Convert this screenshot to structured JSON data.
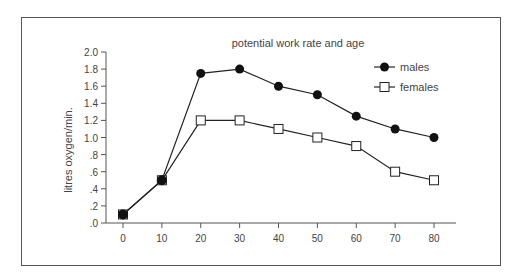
{
  "chart_data": {
    "type": "line",
    "title": "potential work rate and age",
    "xlabel": "",
    "ylabel": "litres oxygen/min.",
    "x": [
      0,
      10,
      20,
      30,
      40,
      50,
      60,
      70,
      80
    ],
    "x_tick_labels": [
      "0",
      "10",
      "20",
      "30",
      "40",
      "50",
      "60",
      "70",
      "80"
    ],
    "y_tick_values": [
      0,
      0.2,
      0.4,
      0.6,
      0.8,
      1.0,
      1.2,
      1.4,
      1.6,
      1.8,
      2.0
    ],
    "y_tick_labels": [
      ".0",
      ".2",
      ".4",
      ".6",
      ".8",
      "1.0",
      "1.2",
      "1.4",
      "1.6",
      "1.8",
      "2.0"
    ],
    "xlim": [
      0,
      80
    ],
    "ylim": [
      0,
      2.0
    ],
    "grid": false,
    "legend_position": "upper right",
    "series": [
      {
        "name": "males",
        "marker": "filled-circle",
        "values": [
          0.1,
          0.5,
          1.75,
          1.8,
          1.6,
          1.5,
          1.25,
          1.1,
          1.0
        ]
      },
      {
        "name": "females",
        "marker": "open-square",
        "values": [
          0.1,
          0.5,
          1.2,
          1.2,
          1.1,
          1.0,
          0.9,
          0.6,
          0.5
        ]
      }
    ]
  },
  "colors": {
    "line": "#222222",
    "axis": "#555555",
    "text": "#444444"
  }
}
